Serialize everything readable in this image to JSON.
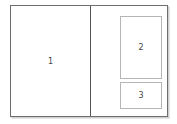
{
  "diagram": {
    "type": "page-spread-layout",
    "regions": [
      {
        "id": "1",
        "label": "1",
        "location": "left page"
      },
      {
        "id": "2",
        "label": "2",
        "location": "right page, upper box"
      },
      {
        "id": "3",
        "label": "3",
        "location": "right page, lower box"
      }
    ]
  }
}
